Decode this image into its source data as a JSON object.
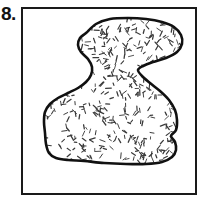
{
  "figure": {
    "problem_number": "8.",
    "caption": "",
    "frame": {
      "stroke_color": "#1a1a1a",
      "fill_color": "#ffffff",
      "x": 22,
      "y": 8,
      "width": 174,
      "height": 186,
      "stroke_width": 2
    },
    "shape": {
      "name": "irregular-blob",
      "description": "hand-drawn closed irregular region with two lobes joined at a waist",
      "stroke_color": "#111111",
      "fill_color": "#ffffff",
      "stroke_width": 2.6,
      "texture": "random-dash-stipple",
      "texture_color": "#3a3a3a",
      "texture_dash_count": 520,
      "outline_points": [
        [
          86,
          33
        ],
        [
          96,
          24
        ],
        [
          110,
          19
        ],
        [
          128,
          18
        ],
        [
          146,
          19
        ],
        [
          162,
          22
        ],
        [
          174,
          27
        ],
        [
          181,
          35
        ],
        [
          182,
          44
        ],
        [
          177,
          52
        ],
        [
          166,
          58
        ],
        [
          153,
          62
        ],
        [
          143,
          66
        ],
        [
          138,
          70
        ],
        [
          142,
          76
        ],
        [
          150,
          83
        ],
        [
          160,
          91
        ],
        [
          169,
          100
        ],
        [
          175,
          110
        ],
        [
          177,
          120
        ],
        [
          176,
          130
        ],
        [
          171,
          136
        ],
        [
          175,
          142
        ],
        [
          176,
          150
        ],
        [
          172,
          157
        ],
        [
          162,
          162
        ],
        [
          146,
          164
        ],
        [
          126,
          164
        ],
        [
          104,
          163
        ],
        [
          84,
          161
        ],
        [
          68,
          160
        ],
        [
          56,
          158
        ],
        [
          49,
          153
        ],
        [
          46,
          144
        ],
        [
          45,
          133
        ],
        [
          44,
          122
        ],
        [
          45,
          112
        ],
        [
          50,
          104
        ],
        [
          58,
          98
        ],
        [
          68,
          93
        ],
        [
          78,
          88
        ],
        [
          86,
          82
        ],
        [
          91,
          75
        ],
        [
          92,
          67
        ],
        [
          88,
          59
        ],
        [
          81,
          52
        ],
        [
          78,
          45
        ],
        [
          80,
          38
        ]
      ]
    }
  }
}
